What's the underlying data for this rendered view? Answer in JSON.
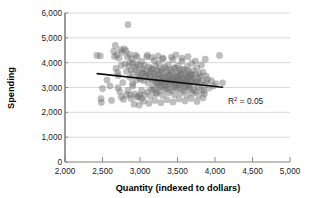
{
  "chart_data": {
    "type": "scatter",
    "title": "",
    "xlabel": "Quantity (indexed to dollars)",
    "ylabel": "Spending",
    "xlim": [
      2000,
      5000
    ],
    "ylim": [
      0,
      6000
    ],
    "xticks": [
      2000,
      2500,
      3000,
      3500,
      4000,
      4500,
      5000
    ],
    "xtick_labels": [
      "2,000",
      "2,500",
      "3,000",
      "3,500",
      "4,000",
      "4,500",
      "5,000"
    ],
    "yticks": [
      0,
      1000,
      2000,
      3000,
      4000,
      5000,
      6000
    ],
    "ytick_labels": [
      "0",
      "1,000",
      "2,000",
      "3,000",
      "4,000",
      "5,000",
      "6,000"
    ],
    "grid": "horizontal",
    "legend": "none",
    "annotations": [
      {
        "name": "r-squared",
        "text_prefix": "R",
        "text_sup": "2",
        "text_suffix": "= 0.05",
        "x": 4400,
        "y": 2500
      }
    ],
    "trendline": {
      "name": "linear-fit",
      "x_start": 2430,
      "y_start": 3560,
      "x_end": 4100,
      "y_end": 3010,
      "color": "#0d0d0d",
      "slope": -0.329,
      "intercept": 4360
    },
    "marker": {
      "color": "#6e6e6e",
      "radius": 3.4,
      "opacity": 0.45
    },
    "series": [
      {
        "name": "observations",
        "points": [
          [
            2425,
            4290
          ],
          [
            2470,
            4270
          ],
          [
            2480,
            2550
          ],
          [
            2485,
            2400
          ],
          [
            2500,
            2960
          ],
          [
            2560,
            3300
          ],
          [
            2600,
            3060
          ],
          [
            2620,
            2480
          ],
          [
            2650,
            4460
          ],
          [
            2660,
            4250
          ],
          [
            2670,
            4700
          ],
          [
            2680,
            3770
          ],
          [
            2690,
            4300
          ],
          [
            2700,
            3610
          ],
          [
            2705,
            2990
          ],
          [
            2710,
            3480
          ],
          [
            2720,
            4180
          ],
          [
            2730,
            2840
          ],
          [
            2740,
            4520
          ],
          [
            2750,
            3890
          ],
          [
            2760,
            4420
          ],
          [
            2770,
            3200
          ],
          [
            2780,
            2520
          ],
          [
            2790,
            4550
          ],
          [
            2800,
            3950
          ],
          [
            2810,
            4480
          ],
          [
            2820,
            3650
          ],
          [
            2830,
            4240
          ],
          [
            2840,
            5530
          ],
          [
            2850,
            3870
          ],
          [
            2860,
            4330
          ],
          [
            2865,
            3410
          ],
          [
            2870,
            4010
          ],
          [
            2880,
            3700
          ],
          [
            2890,
            4150
          ],
          [
            2900,
            3560
          ],
          [
            2905,
            3060
          ],
          [
            2910,
            3980
          ],
          [
            2920,
            2330
          ],
          [
            2930,
            3820
          ],
          [
            2940,
            4300
          ],
          [
            2950,
            3720
          ],
          [
            2960,
            3930
          ],
          [
            2970,
            3480
          ],
          [
            2980,
            3610
          ],
          [
            2990,
            2290
          ],
          [
            3000,
            3880
          ],
          [
            3010,
            3330
          ],
          [
            3020,
            4050
          ],
          [
            3030,
            3570
          ],
          [
            3040,
            3760
          ],
          [
            3050,
            3280
          ],
          [
            3060,
            3900
          ],
          [
            3070,
            3450
          ],
          [
            3080,
            3660
          ],
          [
            3090,
            4230
          ],
          [
            3100,
            3540
          ],
          [
            3110,
            3180
          ],
          [
            3120,
            3830
          ],
          [
            3130,
            3390
          ],
          [
            3140,
            3620
          ],
          [
            3150,
            2920
          ],
          [
            3160,
            3740
          ],
          [
            3170,
            3300
          ],
          [
            3180,
            3560
          ],
          [
            3190,
            4090
          ],
          [
            3200,
            3420
          ],
          [
            3210,
            3880
          ],
          [
            3215,
            2780
          ],
          [
            3220,
            3190
          ],
          [
            3230,
            3650
          ],
          [
            3240,
            3350
          ],
          [
            3250,
            3970
          ],
          [
            3260,
            3520
          ],
          [
            3270,
            3080
          ],
          [
            3280,
            3700
          ],
          [
            3290,
            3260
          ],
          [
            3300,
            3590
          ],
          [
            3310,
            4180
          ],
          [
            3320,
            3400
          ],
          [
            3330,
            3840
          ],
          [
            3340,
            2980
          ],
          [
            3350,
            3230
          ],
          [
            3360,
            3630
          ],
          [
            3370,
            3310
          ],
          [
            3380,
            3920
          ],
          [
            3390,
            3490
          ],
          [
            3400,
            3140
          ],
          [
            3410,
            3680
          ],
          [
            3420,
            3270
          ],
          [
            3430,
            3560
          ],
          [
            3440,
            4120
          ],
          [
            3450,
            3380
          ],
          [
            3460,
            3790
          ],
          [
            3470,
            3020
          ],
          [
            3480,
            3220
          ],
          [
            3490,
            3600
          ],
          [
            3500,
            3330
          ],
          [
            3505,
            3880
          ],
          [
            3510,
            3460
          ],
          [
            3520,
            3100
          ],
          [
            3530,
            3640
          ],
          [
            3540,
            3250
          ],
          [
            3550,
            3530
          ],
          [
            3560,
            4060
          ],
          [
            3570,
            3360
          ],
          [
            3580,
            3720
          ],
          [
            3590,
            2960
          ],
          [
            3600,
            3190
          ],
          [
            3610,
            3570
          ],
          [
            3620,
            3290
          ],
          [
            3630,
            3850
          ],
          [
            3640,
            3430
          ],
          [
            3650,
            3070
          ],
          [
            3660,
            3600
          ],
          [
            3670,
            3210
          ],
          [
            3680,
            3490
          ],
          [
            3690,
            3980
          ],
          [
            3700,
            3320
          ],
          [
            3710,
            3680
          ],
          [
            3720,
            2900
          ],
          [
            3730,
            3150
          ],
          [
            3740,
            3530
          ],
          [
            3750,
            3240
          ],
          [
            3760,
            3790
          ],
          [
            3770,
            3390
          ],
          [
            3780,
            3010
          ],
          [
            3790,
            3550
          ],
          [
            3800,
            3170
          ],
          [
            3810,
            3440
          ],
          [
            3820,
            3910
          ],
          [
            3830,
            3280
          ],
          [
            3840,
            3620
          ],
          [
            3850,
            2860
          ],
          [
            3860,
            3100
          ],
          [
            3870,
            4140
          ],
          [
            3880,
            3470
          ],
          [
            3890,
            3200
          ],
          [
            3900,
            3330
          ],
          [
            3920,
            2980
          ],
          [
            3950,
            3280
          ],
          [
            3980,
            3060
          ],
          [
            4010,
            3150
          ],
          [
            4060,
            4290
          ],
          [
            4100,
            3190
          ],
          [
            2750,
            2620
          ],
          [
            2820,
            2700
          ],
          [
            2880,
            2560
          ],
          [
            2930,
            2740
          ],
          [
            2980,
            2620
          ],
          [
            3020,
            2880
          ],
          [
            3060,
            2700
          ],
          [
            3100,
            2820
          ],
          [
            3140,
            2640
          ],
          [
            3180,
            2900
          ],
          [
            3220,
            2750
          ],
          [
            3260,
            2860
          ],
          [
            3300,
            2680
          ],
          [
            3340,
            2920
          ],
          [
            3380,
            2790
          ],
          [
            3420,
            2870
          ],
          [
            3460,
            2700
          ],
          [
            3500,
            2940
          ],
          [
            3540,
            2780
          ],
          [
            3580,
            2860
          ],
          [
            3620,
            2690
          ],
          [
            3660,
            2930
          ],
          [
            3700,
            2770
          ],
          [
            3740,
            2840
          ],
          [
            3780,
            2680
          ],
          [
            3820,
            2900
          ],
          [
            3860,
            2750
          ],
          [
            3050,
            2450
          ],
          [
            3120,
            2360
          ],
          [
            3200,
            2480
          ],
          [
            3280,
            2390
          ],
          [
            3360,
            2510
          ],
          [
            3440,
            2420
          ],
          [
            3520,
            2540
          ],
          [
            3600,
            2460
          ],
          [
            3680,
            2560
          ],
          [
            3760,
            2440
          ],
          [
            3840,
            2580
          ],
          [
            3160,
            4210
          ],
          [
            3240,
            4270
          ],
          [
            3420,
            4220
          ],
          [
            3560,
            4180
          ],
          [
            3640,
            4240
          ],
          [
            3740,
            4060
          ],
          [
            3300,
            4150
          ],
          [
            3100,
            4300
          ],
          [
            2960,
            4230
          ],
          [
            3480,
            4310
          ],
          [
            3180,
            3010
          ],
          [
            3260,
            3000
          ],
          [
            3340,
            3050
          ],
          [
            3420,
            2990
          ],
          [
            3500,
            3020
          ],
          [
            3580,
            3040
          ],
          [
            3660,
            3000
          ],
          [
            3240,
            3150
          ],
          [
            3320,
            3120
          ],
          [
            3400,
            3170
          ],
          [
            3480,
            3130
          ],
          [
            3560,
            3160
          ],
          [
            3640,
            3140
          ],
          [
            3280,
            3380
          ],
          [
            3360,
            3410
          ],
          [
            3440,
            3360
          ],
          [
            3520,
            3400
          ],
          [
            3600,
            3370
          ],
          [
            3680,
            3420
          ],
          [
            3200,
            3250
          ],
          [
            3290,
            3230
          ],
          [
            3370,
            3270
          ],
          [
            3450,
            3240
          ],
          [
            3530,
            3280
          ],
          [
            3610,
            3250
          ],
          [
            3690,
            3290
          ],
          [
            3770,
            3260
          ],
          [
            3130,
            3480
          ],
          [
            3210,
            3510
          ],
          [
            3290,
            3460
          ],
          [
            3370,
            3500
          ],
          [
            3450,
            3470
          ],
          [
            3530,
            3510
          ],
          [
            3610,
            3480
          ],
          [
            3690,
            3520
          ],
          [
            3150,
            3750
          ],
          [
            3230,
            3720
          ],
          [
            3310,
            3770
          ],
          [
            3390,
            3730
          ],
          [
            3470,
            3780
          ],
          [
            3550,
            3740
          ],
          [
            3630,
            3700
          ],
          [
            2950,
            3300
          ],
          [
            2900,
            3150
          ],
          [
            2870,
            2700
          ],
          [
            2840,
            2880
          ],
          [
            3000,
            2700
          ],
          [
            3020,
            2560
          ],
          [
            2960,
            2620
          ],
          [
            3070,
            3480
          ],
          [
            2990,
            3400
          ],
          [
            3040,
            3600
          ]
        ]
      }
    ]
  },
  "axis": {
    "y_title": "Spending",
    "x_title": "Quantity (indexed to dollars)"
  },
  "colors": {
    "marker": "#6e6e6e",
    "trendline": "#0d0d0d",
    "gridline": "#c9c9c9",
    "axis": "#808080",
    "text": "#1a1a1a",
    "background": "#ffffff"
  }
}
